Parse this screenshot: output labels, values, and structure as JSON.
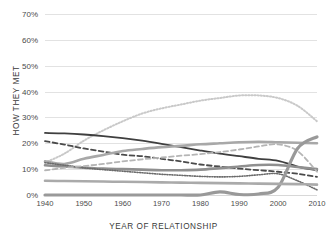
{
  "chart_data": {
    "type": "line",
    "title": "",
    "xlabel": "YEAR OF RELATIONSHIP",
    "ylabel": "HOW THEY MET",
    "xlim": [
      1940,
      2010
    ],
    "ylim": [
      0,
      70
    ],
    "grid": true,
    "legend_position": "none",
    "x_ticks": [
      "1940",
      "1950",
      "1960",
      "1970",
      "1980",
      "1990",
      "2000",
      "2010"
    ],
    "x_tick_values": [
      1940,
      1950,
      1960,
      1970,
      1980,
      1990,
      2000,
      2010
    ],
    "y_ticks": [
      "0%",
      "10%",
      "20%",
      "30%",
      "40%",
      "50%",
      "60%",
      "70%"
    ],
    "y_tick_values": [
      0,
      10,
      20,
      30,
      40,
      50,
      60,
      70
    ],
    "x": [
      1940,
      1945,
      1950,
      1955,
      1960,
      1965,
      1970,
      1975,
      1980,
      1985,
      1990,
      1995,
      2000,
      2005,
      2010
    ],
    "series": [
      {
        "name": "Met through friends",
        "style": "dotted",
        "color": "#c9c9c9",
        "width": 2.0,
        "values": [
          12.5,
          16.0,
          21.0,
          25.0,
          28.5,
          31.5,
          33.5,
          35.0,
          36.5,
          37.5,
          38.5,
          38.5,
          37.5,
          34.5,
          28.5
        ]
      },
      {
        "name": "Met through family",
        "style": "solid",
        "color": "#3f3f3f",
        "width": 1.8,
        "values": [
          24.0,
          23.8,
          23.4,
          22.8,
          22.0,
          21.0,
          19.8,
          18.5,
          17.2,
          16.0,
          15.0,
          14.0,
          13.2,
          11.0,
          9.5
        ]
      },
      {
        "name": "Met as co-workers",
        "style": "dashed",
        "color": "#4a4a4a",
        "width": 1.8,
        "values": [
          20.8,
          19.5,
          18.0,
          16.8,
          15.6,
          15.0,
          14.0,
          13.0,
          11.8,
          11.0,
          10.2,
          9.6,
          9.0,
          8.2,
          7.0
        ]
      },
      {
        "name": "Met in primary or secondary school",
        "style": "solid",
        "color": "#a8a8a8",
        "width": 2.6,
        "values": [
          13.0,
          12.0,
          14.0,
          15.5,
          17.0,
          17.8,
          18.5,
          19.0,
          19.6,
          20.0,
          20.4,
          20.6,
          20.4,
          20.2,
          20.0
        ]
      },
      {
        "name": "Met in college",
        "style": "solid",
        "color": "#8f8f8f",
        "width": 2.6,
        "values": [
          11.5,
          11.0,
          10.6,
          10.2,
          10.0,
          9.8,
          9.6,
          9.6,
          9.8,
          10.4,
          11.0,
          11.6,
          11.6,
          10.8,
          10.0
        ]
      },
      {
        "name": "Met through church",
        "style": "dotted",
        "color": "#6b6b6b",
        "width": 1.6,
        "values": [
          12.5,
          11.5,
          10.5,
          9.8,
          9.2,
          8.6,
          8.0,
          7.6,
          7.2,
          7.0,
          7.2,
          7.8,
          8.2,
          5.5,
          2.0
        ]
      },
      {
        "name": "Met in bar or restaurant",
        "style": "dashed",
        "color": "#b5b5b5",
        "width": 1.8,
        "values": [
          9.5,
          10.5,
          11.2,
          12.0,
          13.0,
          13.8,
          14.5,
          15.2,
          15.8,
          16.6,
          17.6,
          18.8,
          19.6,
          17.0,
          9.0
        ]
      },
      {
        "name": "Met online",
        "style": "solid",
        "color": "#999999",
        "width": 3.2,
        "values": [
          0.0,
          0.0,
          0.0,
          0.0,
          0.0,
          0.0,
          0.0,
          0.0,
          0.0,
          1.2,
          0.2,
          0.4,
          3.0,
          18.0,
          22.5
        ]
      },
      {
        "name": "Met as neighbors",
        "style": "solid",
        "color": "#aaaaaa",
        "width": 2.6,
        "values": [
          5.5,
          5.4,
          5.3,
          5.2,
          5.1,
          5.0,
          4.9,
          4.8,
          4.7,
          4.6,
          4.5,
          4.4,
          4.3,
          4.2,
          4.0
        ]
      }
    ]
  }
}
